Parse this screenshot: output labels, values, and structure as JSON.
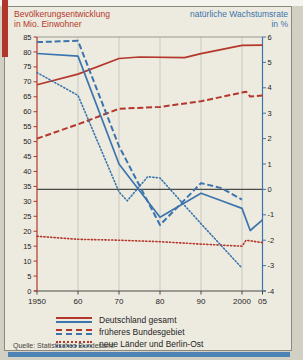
{
  "panel": {
    "title_left": "Bevölkerungsentwicklung\nin Mio. Einwohner",
    "title_right": "natürliche Wachstumsrate\nin %",
    "source": "Quelle: Statistisches Bundesamt"
  },
  "colors": {
    "red": "#b5362b",
    "blue": "#3c74ad",
    "grid": "#c5c4be",
    "axis_dark": "#4b4b47",
    "card_bg": "#edebdf",
    "accent_red": "#b3362a",
    "accent_blue": "#4d83b5"
  },
  "chart_data": {
    "type": "line",
    "axis_left": {
      "label": "in Mio. Einwohner",
      "min": 0,
      "max": 85,
      "step": 5,
      "color": "#b5362b"
    },
    "axis_right": {
      "label": "in %",
      "min": -4,
      "max": 6,
      "step": 1,
      "color": "#3c74ad"
    },
    "x_axis": {
      "min": 1950,
      "max": 2005
    },
    "grid_years": [
      1960,
      1970,
      1980,
      1990,
      2000
    ],
    "x_ticks": {
      "years": [
        1950,
        1960,
        1970,
        1980,
        1990,
        2000,
        2005
      ],
      "labels": [
        "1950",
        "60",
        "70",
        "80",
        "90",
        "2000",
        "05"
      ]
    },
    "series": [
      {
        "name": "bevoelkerung-deutschland-gesamt",
        "legend": "Deutschland gesamt",
        "axis": "left",
        "unit": "Mio. Einwohner",
        "style": "solid",
        "color": "#b5362b",
        "points": [
          [
            1950,
            69
          ],
          [
            1960,
            72.6
          ],
          [
            1970,
            77.8
          ],
          [
            1975,
            78.3
          ],
          [
            1986,
            78.1
          ],
          [
            1990,
            79.4
          ],
          [
            2000,
            82.2
          ],
          [
            2005,
            82.3
          ]
        ]
      },
      {
        "name": "bevoelkerung-frueheres-bundesgebiet",
        "legend": "früheres Bundesgebiet",
        "axis": "left",
        "unit": "Mio. Einwohner",
        "style": "dashed",
        "color": "#b5362b",
        "points": [
          [
            1950,
            51
          ],
          [
            1960,
            55.8
          ],
          [
            1970,
            61
          ],
          [
            1980,
            61.6
          ],
          [
            1990,
            63.5
          ],
          [
            2000,
            66.4
          ],
          [
            2001,
            66.7
          ],
          [
            2002,
            65.1
          ],
          [
            2005,
            65.4
          ]
        ]
      },
      {
        "name": "bevoelkerung-neue-laender-berlin-ost",
        "legend": "neue Länder und Berlin-Ost",
        "axis": "left",
        "unit": "Mio. Einwohner",
        "style": "dotted",
        "color": "#b5362b",
        "points": [
          [
            1950,
            18.3
          ],
          [
            1960,
            17.3
          ],
          [
            1970,
            17
          ],
          [
            1980,
            16.5
          ],
          [
            1990,
            15.7
          ],
          [
            2000,
            15
          ],
          [
            2001,
            17
          ],
          [
            2005,
            16.2
          ]
        ]
      },
      {
        "name": "wachstumsrate-deutschland-gesamt",
        "legend": "Deutschland gesamt",
        "axis": "right",
        "unit": "%",
        "style": "solid",
        "color": "#3c74ad",
        "points": [
          [
            1950,
            5.35
          ],
          [
            1960,
            5.25
          ],
          [
            1970,
            1.0
          ],
          [
            1980,
            -1.1
          ],
          [
            1990,
            -0.15
          ],
          [
            1995,
            -0.45
          ],
          [
            2000,
            -0.75
          ],
          [
            2002,
            -1.62
          ],
          [
            2005,
            -1.2
          ]
        ]
      },
      {
        "name": "wachstumsrate-frueheres-bundesgebiet",
        "legend": "früheres Bundesgebiet",
        "axis": "right",
        "unit": "%",
        "style": "dashed",
        "color": "#3c74ad",
        "points": [
          [
            1950,
            5.8
          ],
          [
            1960,
            5.85
          ],
          [
            1970,
            1.7
          ],
          [
            1980,
            -1.4
          ],
          [
            1990,
            0.25
          ],
          [
            1995,
            0.05
          ],
          [
            2000,
            -0.4
          ]
        ]
      },
      {
        "name": "wachstumsrate-neue-laender-berlin-ost",
        "legend": "neue Länder und Berlin-Ost",
        "axis": "right",
        "unit": "%",
        "style": "dotted",
        "color": "#3c74ad",
        "points": [
          [
            1950,
            4.6
          ],
          [
            1960,
            3.7
          ],
          [
            1970,
            -0.1
          ],
          [
            1972,
            -0.45
          ],
          [
            1977,
            0.5
          ],
          [
            1980,
            0.45
          ],
          [
            1990,
            -1.35
          ],
          [
            2000,
            -3.1
          ]
        ]
      }
    ],
    "legend": [
      {
        "label": "Deutschland gesamt",
        "style": "solid"
      },
      {
        "label": "früheres Bundesgebiet",
        "style": "dashed"
      },
      {
        "label": "neue Länder und Berlin-Ost",
        "style": "dotted"
      }
    ]
  }
}
